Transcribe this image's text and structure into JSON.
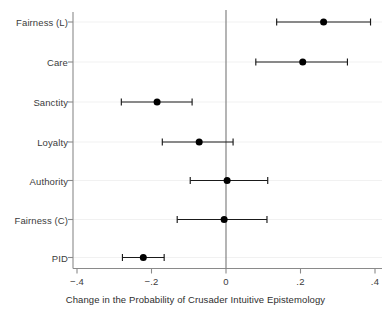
{
  "chart_data": {
    "type": "scatter",
    "orientation": "horizontal",
    "title": "",
    "xlabel": "Change in the Probability of Crusader Intuitive Epistemology",
    "ylabel": "",
    "xlim": [
      -0.45,
      0.42
    ],
    "xticks": [
      -0.4,
      -0.2,
      0,
      0.2,
      0.4
    ],
    "xtick_labels": [
      "−.4",
      "−.2",
      "0",
      ".2",
      ".4"
    ],
    "grid": true,
    "grid_axis": "y",
    "legend": "none",
    "reference_line_x": 0,
    "categories": [
      "Fairness (L)",
      "Care",
      "Sanctity",
      "Loyalty",
      "Authority",
      "Fairness (C)",
      "PID"
    ],
    "values": [
      0.262,
      0.206,
      -0.185,
      -0.072,
      0.003,
      -0.005,
      -0.222
    ],
    "ci_low": [
      0.136,
      0.08,
      -0.281,
      -0.171,
      -0.096,
      -0.131,
      -0.278
    ],
    "ci_high": [
      0.388,
      0.326,
      -0.091,
      0.019,
      0.112,
      0.11,
      -0.166
    ],
    "series": [
      {
        "name": "Change in probability",
        "points": [
          {
            "category": "Fairness (L)",
            "estimate": 0.262,
            "ci_low": 0.136,
            "ci_high": 0.388
          },
          {
            "category": "Care",
            "estimate": 0.206,
            "ci_low": 0.08,
            "ci_high": 0.326
          },
          {
            "category": "Sanctity",
            "estimate": -0.185,
            "ci_low": -0.281,
            "ci_high": -0.091
          },
          {
            "category": "Loyalty",
            "estimate": -0.072,
            "ci_low": -0.171,
            "ci_high": 0.019
          },
          {
            "category": "Authority",
            "estimate": 0.003,
            "ci_low": -0.096,
            "ci_high": 0.112
          },
          {
            "category": "Fairness (C)",
            "estimate": -0.005,
            "ci_low": -0.131,
            "ci_high": 0.11
          },
          {
            "category": "PID",
            "estimate": -0.222,
            "ci_low": -0.278,
            "ci_high": -0.166
          }
        ]
      }
    ],
    "colors": {
      "marker": "#000000",
      "error_bar": "#1a1a1a",
      "axis": "#8a8a8a",
      "gridline": "#f1f1f1",
      "reference_line": "#777777",
      "text": "#3b3b3b",
      "background": "#ffffff"
    }
  }
}
